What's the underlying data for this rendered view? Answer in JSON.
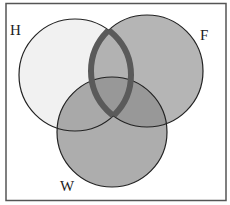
{
  "diagram": {
    "type": "venn",
    "sets": [
      {
        "id": "H",
        "label": "H",
        "cx": 75,
        "cy": 75,
        "r": 56,
        "fill": "#f1f1f1",
        "label_x": 10,
        "label_y": 35
      },
      {
        "id": "F",
        "label": "F",
        "cx": 147,
        "cy": 71,
        "r": 56,
        "fill": "#b4b4b4",
        "label_x": 200,
        "label_y": 40
      },
      {
        "id": "W",
        "label": "W",
        "cx": 112,
        "cy": 132,
        "r": 55,
        "fill": "#a9a9a9",
        "label_x": 60,
        "label_y": 191
      }
    ],
    "highlighted_region": "H ∩ F",
    "highlight_stroke_color": "#5a5a5a",
    "outline_color": "#222222",
    "frame_color": "#555555",
    "background": "#ffffff"
  }
}
